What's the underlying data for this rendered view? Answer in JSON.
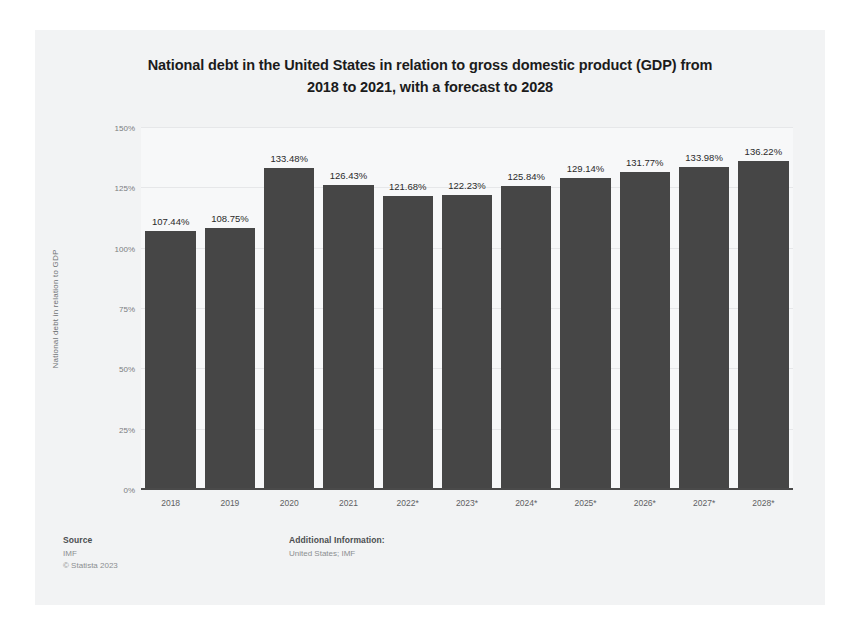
{
  "chart_data": {
    "type": "bar",
    "title": "National debt in the United States in relation to gross domestic product (GDP) from 2018 to 2021, with a forecast to 2028",
    "title_line1": "National debt in the United States in relation to gross domestic product (GDP) from",
    "title_line2": "2018 to 2021, with a forecast to 2028",
    "xlabel": "",
    "ylabel": "National debt in relation to GDP",
    "categories": [
      "2018",
      "2019",
      "2020",
      "2021",
      "2022*",
      "2023*",
      "2024*",
      "2025*",
      "2026*",
      "2027*",
      "2028*"
    ],
    "values": [
      107.44,
      108.75,
      133.48,
      126.43,
      121.68,
      122.23,
      125.84,
      129.14,
      131.77,
      133.98,
      136.22
    ],
    "value_labels": [
      "107.44%",
      "108.75%",
      "133.48%",
      "126.43%",
      "121.68%",
      "122.23%",
      "125.84%",
      "129.14%",
      "131.77%",
      "133.98%",
      "136.22%"
    ],
    "ylim": [
      0,
      150
    ],
    "y_ticks": [
      0,
      25,
      50,
      75,
      100,
      125,
      150
    ],
    "y_tick_labels": [
      "0%",
      "25%",
      "50%",
      "75%",
      "100%",
      "125%",
      "150%"
    ],
    "grid": true,
    "legend": false,
    "bar_color": "#464646",
    "plot_background": "#f7f8f9",
    "card_background": "#f2f3f4"
  },
  "footer": {
    "source_heading": "Source",
    "source_lines": [
      "IMF",
      "© Statista 2023"
    ],
    "additional_heading": "Additional Information:",
    "additional_lines": [
      "United States; IMF"
    ]
  }
}
